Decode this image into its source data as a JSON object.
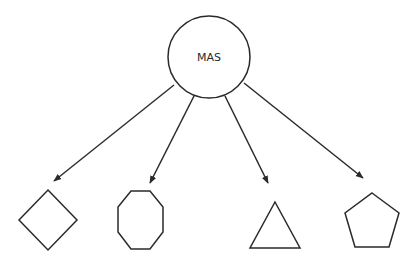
{
  "diagram": {
    "root": {
      "label": "MAS",
      "shape": "circle"
    },
    "children": [
      {
        "shape": "diamond"
      },
      {
        "shape": "octagon"
      },
      {
        "shape": "triangle"
      },
      {
        "shape": "pentagon"
      }
    ],
    "edges": [
      {
        "from": "MAS",
        "to": "diamond",
        "type": "arrow"
      },
      {
        "from": "MAS",
        "to": "octagon",
        "type": "arrow"
      },
      {
        "from": "MAS",
        "to": "triangle",
        "type": "arrow"
      },
      {
        "from": "MAS",
        "to": "pentagon",
        "type": "arrow"
      }
    ],
    "colors": {
      "stroke": "#2a2a2a",
      "background": "#ffffff"
    }
  }
}
